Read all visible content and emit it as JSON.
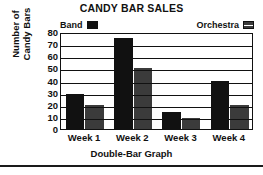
{
  "chart_data": {
    "type": "bar",
    "title": "CANDY BAR SALES",
    "subtitle": "",
    "xlabel": "Double-Bar Graph",
    "ylabel": "Number of Candy Bars",
    "ylabel_line1": "Number of",
    "ylabel_line2": "Candy Bars",
    "categories": [
      "Week 1",
      "Week 2",
      "Week 3",
      "Week 4"
    ],
    "series": [
      {
        "name": "Band",
        "values": [
          29,
          75,
          14,
          40
        ],
        "color": "#111111",
        "pattern": "solid"
      },
      {
        "name": "Orchestra",
        "values": [
          20,
          50,
          9,
          20
        ],
        "color": "#3b3b3b",
        "pattern": "hatched"
      }
    ],
    "ylim": [
      0,
      80
    ],
    "ytick_step": 10,
    "yticks": [
      "80",
      "70",
      "60",
      "50",
      "40",
      "30",
      "20",
      "10",
      "0"
    ],
    "grid": true,
    "grid_axis": "y",
    "legend_position": "top"
  },
  "legend": {
    "entries": [
      {
        "label": "Band",
        "swatch": "solid-black-swatch"
      },
      {
        "label": "Orchestra",
        "swatch": "hatched-gray-swatch"
      }
    ]
  },
  "colors": {
    "band": "#111111",
    "orchestra": "#3b3b3b",
    "axis": "#111111",
    "background": "#ffffff"
  }
}
